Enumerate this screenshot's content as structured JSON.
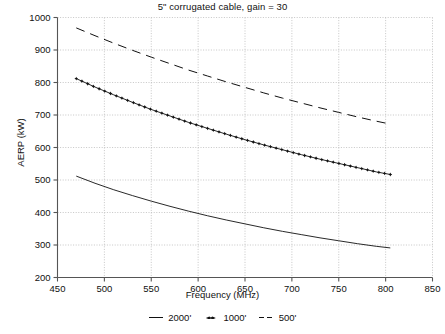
{
  "chart_data": {
    "type": "line",
    "title": "5ʺ corrugated cable, gain = 30",
    "xlabel": "Frequency (MHz)",
    "ylabel": "AERP (kW)",
    "xlim": [
      450,
      850
    ],
    "ylim": [
      200,
      1000
    ],
    "xticks": [
      450,
      500,
      550,
      600,
      650,
      700,
      750,
      800,
      850
    ],
    "yticks": [
      200,
      300,
      400,
      500,
      600,
      700,
      800,
      900,
      1000
    ],
    "grid": true,
    "legend_position": "bottom",
    "x": [
      470,
      490,
      510,
      530,
      550,
      570,
      590,
      610,
      630,
      650,
      670,
      690,
      710,
      730,
      750,
      770,
      790,
      805
    ],
    "series": [
      {
        "name": "2000'",
        "label": "2000'",
        "style": "solid",
        "marker": "none",
        "color": "#111111",
        "values": [
          512,
          490,
          470,
          452,
          435,
          419,
          404,
          390,
          377,
          365,
          353,
          342,
          332,
          322,
          313,
          304,
          296,
          291
        ]
      },
      {
        "name": "1000'",
        "label": "1000'",
        "style": "solid",
        "marker": "star",
        "color": "#111111",
        "values": [
          812,
          786,
          762,
          739,
          717,
          697,
          677,
          659,
          641,
          624,
          608,
          593,
          578,
          564,
          551,
          538,
          525,
          517
        ]
      },
      {
        "name": "500'",
        "label": "500'",
        "style": "dashed",
        "marker": "none",
        "color": "#111111",
        "values": [
          968,
          944,
          921,
          899,
          878,
          858,
          838,
          820,
          802,
          785,
          768,
          752,
          737,
          722,
          708,
          694,
          681,
          672
        ]
      }
    ]
  },
  "legend": {
    "items": [
      {
        "key": "line-solid-key",
        "label": "2000'"
      },
      {
        "key": "marker-star-key",
        "label": "1000'"
      },
      {
        "key": "line-dashed-key",
        "label": "500'"
      }
    ]
  }
}
